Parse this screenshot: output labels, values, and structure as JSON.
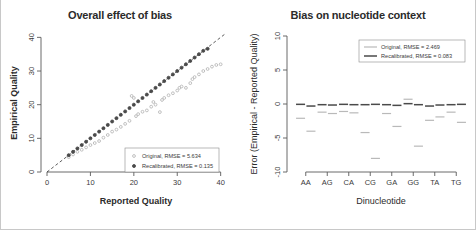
{
  "figure": {
    "background": "#ffffff",
    "border_color": "#c8c8c8"
  },
  "colors": {
    "original": "#b9b9b9",
    "recalibrated": "#4a4a4a",
    "axis": "#5a5a5a",
    "text": "#2b2b2b",
    "identity_line": "#333333"
  },
  "panels": [
    {
      "id": "overall-effect-of-bias",
      "title": "Overall effect of bias"
    },
    {
      "id": "bias-on-nucleotide-context",
      "title": "Bias on nucleotide context"
    }
  ],
  "chart_data": [
    {
      "type": "scatter",
      "title": "Overall effect of bias",
      "xlabel": "Reported Quality",
      "ylabel": "Empirical Quality",
      "xlim": [
        0,
        41
      ],
      "ylim": [
        0,
        41
      ],
      "xticks": [
        0,
        10,
        20,
        30,
        40
      ],
      "yticks": [
        0,
        10,
        20,
        30,
        40
      ],
      "xtick_labels": [
        "0",
        "10",
        "20",
        "30",
        "40"
      ],
      "ytick_labels": [
        "0",
        "10",
        "20",
        "30",
        "40"
      ],
      "grid": false,
      "legend_position": "bottom-right",
      "reference_line": {
        "name": "identity",
        "style": "dashed",
        "from": [
          0,
          0
        ],
        "to": [
          41,
          41
        ]
      },
      "series": [
        {
          "name": "Original",
          "legend_label": "Original, RMSE = 5.634",
          "rmse": 5.634,
          "color": "#b9b9b9",
          "marker": "circle",
          "points": [
            [
              5.0,
              4.4
            ],
            [
              6.0,
              5.2
            ],
            [
              7.0,
              6.0
            ],
            [
              8.0,
              6.6
            ],
            [
              9.0,
              7.3
            ],
            [
              10.0,
              8.0
            ],
            [
              11.0,
              8.6
            ],
            [
              12.0,
              9.2
            ],
            [
              13.0,
              10.2
            ],
            [
              14.0,
              11.0
            ],
            [
              15.0,
              12.0
            ],
            [
              16.0,
              12.6
            ],
            [
              17.0,
              13.4
            ],
            [
              18.0,
              14.3
            ],
            [
              19.0,
              15.2
            ],
            [
              19.5,
              22.6
            ],
            [
              20.0,
              22.0
            ],
            [
              20.5,
              16.6
            ],
            [
              21.0,
              17.2
            ],
            [
              22.0,
              17.9
            ],
            [
              23.0,
              18.3
            ],
            [
              24.0,
              19.4
            ],
            [
              24.5,
              20.8
            ],
            [
              25.0,
              20.0
            ],
            [
              26.0,
              17.8
            ],
            [
              26.5,
              21.4
            ],
            [
              27.0,
              22.0
            ],
            [
              28.0,
              22.8
            ],
            [
              29.0,
              23.4
            ],
            [
              30.0,
              24.2
            ],
            [
              30.5,
              25.0
            ],
            [
              31.0,
              25.4
            ],
            [
              32.0,
              25.0
            ],
            [
              33.0,
              26.4
            ],
            [
              33.5,
              27.6
            ],
            [
              34.0,
              28.2
            ],
            [
              35.0,
              29.0
            ],
            [
              36.0,
              30.0
            ],
            [
              37.0,
              30.6
            ],
            [
              38.0,
              31.3
            ],
            [
              39.0,
              31.8
            ],
            [
              40.0,
              32.0
            ]
          ]
        },
        {
          "name": "Recalibrated",
          "legend_label": "Recalibrated, RMSE = 0.135",
          "rmse": 0.135,
          "color": "#4a4a4a",
          "marker": "circle-filled",
          "points": [
            [
              5.0,
              5.0
            ],
            [
              6.0,
              6.0
            ],
            [
              7.0,
              7.0
            ],
            [
              8.0,
              8.0
            ],
            [
              9.0,
              9.0
            ],
            [
              10.0,
              10.0
            ],
            [
              11.0,
              11.0
            ],
            [
              12.0,
              12.0
            ],
            [
              13.0,
              13.0
            ],
            [
              14.0,
              14.0
            ],
            [
              15.0,
              15.0
            ],
            [
              16.0,
              16.0
            ],
            [
              17.0,
              17.0
            ],
            [
              18.0,
              18.0
            ],
            [
              19.0,
              19.0
            ],
            [
              20.0,
              20.0
            ],
            [
              21.0,
              21.0
            ],
            [
              22.0,
              22.0
            ],
            [
              23.0,
              23.0
            ],
            [
              24.0,
              24.0
            ],
            [
              25.0,
              25.0
            ],
            [
              26.0,
              26.0
            ],
            [
              27.0,
              27.0
            ],
            [
              28.0,
              28.0
            ],
            [
              29.0,
              29.0
            ],
            [
              30.0,
              30.0
            ],
            [
              31.0,
              31.0
            ],
            [
              32.0,
              32.0
            ],
            [
              33.0,
              33.0
            ],
            [
              34.0,
              34.0
            ],
            [
              35.0,
              35.0
            ],
            [
              36.0,
              36.0
            ],
            [
              37.0,
              36.6
            ]
          ]
        }
      ]
    },
    {
      "type": "scatter",
      "title": "Bias on nucleotide context",
      "xlabel": "Dinucleotide",
      "ylabel": "Error (Empirical - Reported Quality)",
      "categories": [
        "AA",
        "AG",
        "CA",
        "CG",
        "GA",
        "GG",
        "TA",
        "TG"
      ],
      "ylim": [
        -10,
        10
      ],
      "yticks": [
        -10,
        -5,
        0,
        5,
        10
      ],
      "ytick_labels": [
        "-10",
        "-5",
        "0",
        "5",
        "10"
      ],
      "grid": false,
      "legend_position": "top-right",
      "series": [
        {
          "name": "Original",
          "legend_label": "Original, RMSE = 2.469",
          "rmse": 2.469,
          "color": "#b9b9b9",
          "marker": "dash",
          "values_per_category": [
            [
              -2.1,
              -4.0
            ],
            [
              -1.2,
              -1.4
            ],
            [
              -1.1,
              -1.3
            ],
            [
              -4.2,
              -8.0
            ],
            [
              -1.4,
              -3.3
            ],
            [
              0.7,
              -6.2
            ],
            [
              -2.4,
              -1.9
            ],
            [
              -1.2,
              -2.7
            ]
          ]
        },
        {
          "name": "Recalibrated",
          "legend_label": "Recalibrated, RMSE = 0.083",
          "rmse": 0.083,
          "color": "#4a4a4a",
          "marker": "dash",
          "values_per_category": [
            [
              -0.05,
              -0.3
            ],
            [
              -0.1,
              -0.15
            ],
            [
              -0.05,
              -0.1
            ],
            [
              -0.1,
              -0.05
            ],
            [
              -0.1,
              -0.2
            ],
            [
              0.05,
              -0.1
            ],
            [
              -0.3,
              -0.15
            ],
            [
              -0.1,
              -0.05
            ]
          ]
        }
      ]
    }
  ]
}
